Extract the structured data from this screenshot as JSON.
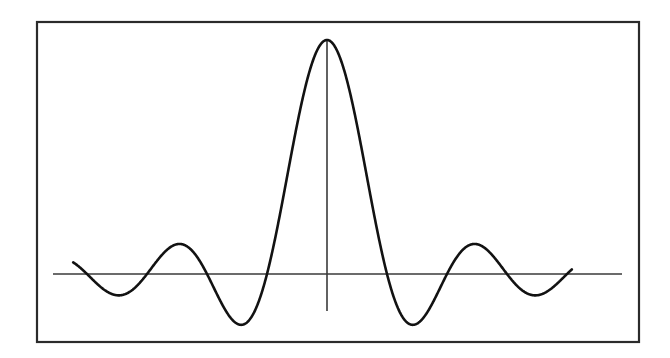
{
  "figure": {
    "title": "",
    "caption": "",
    "background_color": "#ffffff",
    "ink_color": "#1a1a1a"
  },
  "frame": {
    "name": "plot-border",
    "x": 37,
    "y": 22,
    "width": 602,
    "height": 320,
    "stroke_color": "#2b2b2b",
    "stroke_width": 2.2,
    "fill": "#ffffff"
  },
  "axes": {
    "horizontal": {
      "label": "",
      "y": 274,
      "x_start": 53,
      "x_end": 622,
      "stroke_color": "#3a3a3a",
      "stroke_width": 1.6
    },
    "vertical": {
      "label": "",
      "x": 327,
      "y_top": 40,
      "y_bottom": 311,
      "stroke_color": "#3a3a3a",
      "stroke_width": 1.6
    },
    "origin_px": [
      327,
      274
    ],
    "x_unit_px": 60,
    "y_unit_px": 234
  },
  "curve": {
    "name": "sinc-curve",
    "stroke_color": "#121212",
    "stroke_width": 2.6,
    "fill": "none",
    "path_d": "M 72.6 274.0 L 74.2 272.0 L 75.8 270.2 L 77.5 268.6 L 79.1 267.2 L 80.7 266.0 L 82.3 265.1 L 84.0 264.4 L 85.6 263.8 L 87.2 263.5 L 88.8 263.4 L 90.5 263.5 L 92.1 263.8 L 93.7 264.3 L 95.3 265.0 L 97.0 265.8 L 98.6 266.8 L 100.2 268.0 L 101.8 269.3 L 103.5 270.7 L 105.1 272.2 L 106.7 273.8 L 108.3 275.5 L 110.0 277.2 L 111.6 279.0 L 113.2 280.8 L 114.8 282.5 L 116.5 284.2 L 118.1 285.9 L 119.7 287.5 L 121.3 289.0 L 123.0 290.4 L 124.6 291.6 L 126.2 292.7 L 127.8 293.6 L 129.5 294.3 L 131.1 294.9 L 132.7 295.2 L 134.3 295.3 L 136.0 295.1 L 137.6 294.8 L 139.2 294.2 L 140.8 293.4 L 142.5 292.3 L 144.1 291.0 L 145.7 289.5 L 147.3 287.7 L 149.0 285.7 L 150.6 283.5 L 152.2 281.0 L 153.8 278.4 L 155.5 275.5 L 157.1 272.4 L 158.7 269.2 L 160.3 265.8 L 162.0 262.2 L 163.6 258.5 L 165.2 254.7 L 166.8 250.9 L 168.5 247.0 L 170.1 243.1 L 171.7 239.2 L 173.3 235.4 L 175.0 231.6 L 176.6 228.0 L 178.2 224.6 L 179.8 221.4 L 181.5 218.5 L 183.1 215.9 L 184.7 213.7 L 186.3 211.9 L 188.0 210.6 L 189.6 209.8 L 191.2 209.5 L 192.8 209.8 L 194.5 210.8 L 196.1 212.4 L 197.7 214.7 L 199.3 217.7 L 201.0 221.4 L 202.6 225.9 L 204.2 231.2 L 205.8 237.2 L 207.5 244.0 L 209.1 251.5 L 210.7 259.8 L 212.3 268.8 L 214.0 278.5 L 215.6 288.9 L 217.2 299.8 L 218.8 311.3 L 220.5 323.2 L 222.1 335.5 L 223.7 348.1 L 225.3 360.9 L 227.0 373.8 L 228.6 386.6 L 230.2 399.3 L 231.8 411.7 L 233.5 423.7 L 235.1 435.1 L 236.7 445.9 L 238.3 455.8 L 240.0 464.8 L 241.6 472.7 L 243.2 479.4 L 244.8 484.8 L 246.5 488.9 L 248.1 491.5 L 249.7 492.6 L 251.3 492.1 L 253.0 490.0 L 254.6 486.3 L 256.2 480.9 L 257.8 473.8 L 259.5 465.0 L 261.1 454.6 L 262.7 442.5 L 264.3 428.7 L 266.0 413.4 L 267.6 396.5 L 269.2 378.2 L 270.8 358.5 L 272.5 337.5 L 274.1 315.3 L 275.7 292.0 L 277.3 267.7 L 279.0 242.5 L 280.6 216.7 L 282.2 190.3 L 283.8 163.5 L 285.5 136.6 L 287.1 109.7 L 288.7 83.0 L 290.3 56.7 L 292.0 31.0 L 293.6 6.1 L 295.2 -17.7",
    "description": "sinc(x) = sin(pi x)/(pi x)"
  },
  "chart_data": {
    "type": "line",
    "title": "",
    "subtitle": "",
    "xlabel": "",
    "ylabel": "",
    "function": "sinc(x) = sin(pi*x)/(pi*x)",
    "grid": false,
    "legend": null,
    "xlim": [
      -4.23,
      4.08
    ],
    "ylim": [
      -0.217,
      1.0
    ],
    "x_tick_labels": [],
    "y_tick_labels": [],
    "annotations": [],
    "zero_crossings_x": [
      -4,
      -3,
      -2,
      -1,
      1,
      2,
      3,
      4
    ],
    "extrema": [
      {
        "name": "outer-left-minimum",
        "x": -3.48,
        "y": -0.081
      },
      {
        "name": "inner-left-maximum",
        "x": -2.46,
        "y": 0.128
      },
      {
        "name": "inner-left-minimum",
        "x": -1.48,
        "y": -0.205
      },
      {
        "name": "main-lobe-peak",
        "x": 0.0,
        "y": 1.0
      },
      {
        "name": "inner-right-minimum",
        "x": 1.48,
        "y": -0.205
      },
      {
        "name": "inner-right-maximum",
        "x": 2.46,
        "y": 0.128
      },
      {
        "name": "outer-right-minimum",
        "x": 3.48,
        "y": -0.081
      }
    ],
    "series": [
      {
        "name": "sinc",
        "color": "#121212",
        "x": [
          -4.23,
          -4.1,
          -4.0,
          -3.9,
          -3.8,
          -3.7,
          -3.6,
          -3.5,
          -3.4,
          -3.3,
          -3.2,
          -3.1,
          -3.0,
          -2.9,
          -2.8,
          -2.7,
          -2.6,
          -2.5,
          -2.4,
          -2.3,
          -2.2,
          -2.1,
          -2.0,
          -1.9,
          -1.8,
          -1.7,
          -1.6,
          -1.5,
          -1.4,
          -1.3,
          -1.2,
          -1.1,
          -1.0,
          -0.9,
          -0.8,
          -0.7,
          -0.6,
          -0.5,
          -0.4,
          -0.3,
          -0.2,
          -0.1,
          0.0,
          0.1,
          0.2,
          0.3,
          0.4,
          0.5,
          0.6,
          0.7,
          0.8,
          0.9,
          1.0,
          1.1,
          1.2,
          1.3,
          1.4,
          1.5,
          1.6,
          1.7,
          1.8,
          1.9,
          2.0,
          2.1,
          2.2,
          2.3,
          2.4,
          2.5,
          2.6,
          2.7,
          2.8,
          2.9,
          3.0,
          3.1,
          3.2,
          3.3,
          3.4,
          3.5,
          3.6,
          3.7,
          3.8,
          3.9,
          4.0,
          4.08
        ],
        "y": [
          0.0542,
          0.0239,
          0.0,
          -0.0246,
          -0.0492,
          -0.0717,
          -0.0899,
          -0.1021,
          -0.1073,
          -0.1049,
          -0.0953,
          -0.0793,
          -0.0584,
          -0.0344,
          -0.0094,
          0.0145,
          0.0353,
          0.0515,
          0.0617,
          0.0651,
          0.0613,
          0.0505,
          0.0334,
          0.0115,
          -0.0134,
          -0.0389,
          -0.0628,
          -0.0825,
          -0.096,
          -0.1016,
          -0.0983,
          -0.0857,
          -0.0645,
          -0.0359,
          -0.0019,
          0.0351,
          0.0726,
          0.108,
          0.1387,
          0.1626,
          0.1781,
          0.184,
          0.18,
          0.184,
          0.1781,
          0.1626,
          0.1387,
          0.108,
          0.0726,
          0.0351,
          -0.0019,
          -0.0359,
          -0.0645,
          -0.0857,
          -0.0983,
          -0.1016,
          -0.096,
          -0.0825,
          -0.0628,
          -0.0389,
          -0.0134,
          0.0115,
          0.0334,
          0.0505,
          0.0613,
          0.0651,
          0.0617,
          0.0515,
          0.0353,
          0.0145,
          -0.0094,
          -0.0344,
          -0.0584,
          -0.0793,
          -0.0953,
          -0.1049,
          -0.1073,
          -0.1021,
          -0.0899,
          -0.0717,
          -0.0492,
          -0.0246,
          0.0,
          0.0199
        ]
      }
    ]
  }
}
